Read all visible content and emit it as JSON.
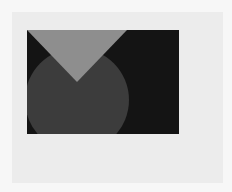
{
  "figure": {
    "background_color": "#f7f7f7",
    "frame_color": "#ececec",
    "rectangle": {
      "color": "#141414",
      "x": 27,
      "y": 30,
      "width": 152,
      "height": 104
    },
    "circle": {
      "color": "#3c3c3c",
      "cx": 50,
      "cy": 70,
      "r": 52
    },
    "triangle": {
      "color": "#8e8e8e",
      "points": "0,0 100,0 50,52"
    }
  }
}
